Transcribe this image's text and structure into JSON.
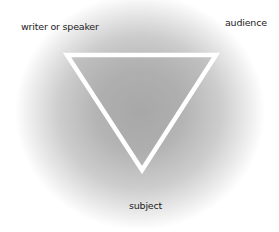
{
  "diagram": {
    "type": "rhetorical-triangle",
    "vertices": {
      "top_left": {
        "label": "writer or speaker"
      },
      "top_right": {
        "label": "audience"
      },
      "bottom": {
        "label": "subject"
      }
    },
    "colors": {
      "triangle_stroke": "#ffffff",
      "glow_center": "#a9a9a9",
      "background": "#ffffff",
      "text": "#222222"
    }
  }
}
